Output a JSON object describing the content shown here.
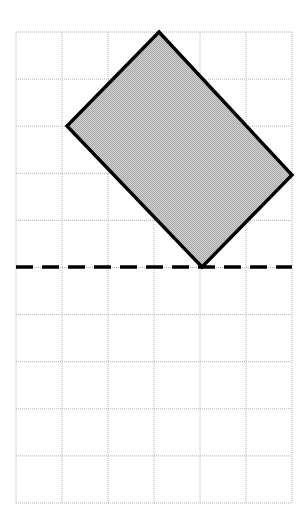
{
  "figure": {
    "canvas": {
      "width": 304,
      "height": 527,
      "background": "#ffffff"
    },
    "grid": {
      "name": "square-grid",
      "left": 16,
      "top": 32,
      "right": 292,
      "bottom": 503,
      "columns": 6,
      "rows": 10,
      "cell_width": 46,
      "cell_height": 47.1,
      "x_lines": [
        16,
        62,
        108,
        154,
        200,
        246,
        292
      ],
      "y_lines": [
        32,
        79.1,
        126.2,
        173.3,
        220.4,
        267.5,
        314.6,
        361.7,
        408.8,
        455.9,
        503
      ],
      "line_color": "#b4b4b4",
      "line_width": 1,
      "line_style": "dotted"
    },
    "shape": {
      "name": "shaded-quadrilateral",
      "kind": "rectangle-rotated",
      "vertices": [
        {
          "label": "top",
          "x": 159,
          "y": 32
        },
        {
          "label": "right",
          "x": 292,
          "y": 175
        },
        {
          "label": "bottom",
          "x": 202,
          "y": 267
        },
        {
          "label": "left",
          "x": 67,
          "y": 126
        }
      ],
      "points": "159,32 292,175 202,267 67,126",
      "fill_color": "#c6c6c6",
      "stroke_color": "#000000",
      "stroke_width": 3.4
    },
    "mirror_line": {
      "name": "dashed-mirror-line",
      "orientation": "horizontal",
      "y": 267,
      "x_start": 16,
      "x_end": 292,
      "color": "#000000",
      "width": 3.4,
      "dash_length": 17,
      "gap_length": 9
    }
  }
}
